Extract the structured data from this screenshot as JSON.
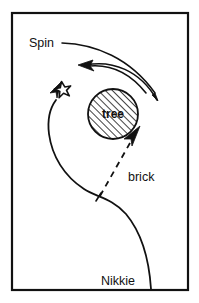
{
  "figure": {
    "background_color": "#ffffff",
    "ink_color": "#111111",
    "frame": {
      "name": "outer-border",
      "x": 12,
      "y": 13,
      "width": 176,
      "height": 277,
      "stroke_width": 2.2,
      "color": "#111111"
    },
    "labels": {
      "spin": "Spin",
      "tree": "tree",
      "brick": "brick",
      "nikkie": "Nikkie"
    },
    "objects": {
      "tree_circle": {
        "name": "tree-circle",
        "cx": 113,
        "cy": 114,
        "r": 25,
        "fill_pattern": "diagonal-hatch",
        "hatch_direction": "forward-slash",
        "stroke_color": "#111111"
      },
      "star": {
        "name": "star-marker",
        "cx": 63,
        "cy": 90,
        "outer_radius": 8.5,
        "inner_radius": 3.6,
        "points": 5,
        "rotation_deg": -10,
        "fill": "#ffffff",
        "stroke_color": "#111111"
      }
    },
    "paths": {
      "spin_leader": {
        "name": "spin-leader-line",
        "description": "line from Spin label curving right and down, tapering to a point at lower right of tree"
      },
      "spin_outer_arc": {
        "name": "spin-outer-arc",
        "description": "outer sweeping arc ending in a taper pointing down-right"
      },
      "spin_inner_arc": {
        "name": "spin-inner-arc",
        "description": "inner arc with solid arrowhead pointing left"
      },
      "nikkie_path": {
        "name": "nikkie-s-curve-path",
        "description": "S-shaped path from Nikkie at bottom right, curving up-left, arrowhead pointing up-right toward the star"
      },
      "brick_path": {
        "name": "brick-dashed-arrow",
        "description": "dashed line from tick mark on the S-curve to an arrowhead pointing up-right at the tree",
        "dash_pattern": "6 5"
      },
      "tick_mark": {
        "name": "path-tick-mark",
        "description": "short perpendicular tick crossing the S-curve where the brick arrow originates"
      }
    }
  }
}
